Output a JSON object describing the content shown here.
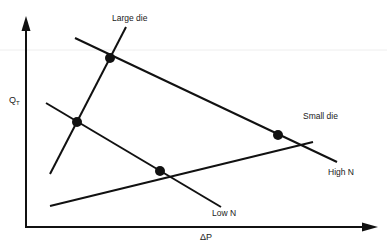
{
  "diagram": {
    "axes": {
      "y_label": "Q",
      "y_label_sub": "T",
      "x_label": "ΔP"
    },
    "lines": [
      {
        "name": "large-die-line",
        "label": "Large die",
        "x1": 50,
        "y1": 174,
        "x2": 126,
        "y2": 27
      },
      {
        "name": "small-die-line",
        "label": "Small die",
        "x1": 50,
        "y1": 206,
        "x2": 313,
        "y2": 142
      },
      {
        "name": "high-n-line",
        "label": "High N",
        "x1": 75,
        "y1": 38,
        "x2": 337,
        "y2": 162
      },
      {
        "name": "low-n-line",
        "label": "Low N",
        "x1": 46,
        "y1": 103,
        "x2": 221,
        "y2": 207
      }
    ],
    "labels": {
      "large_die": "Large die",
      "small_die": "Small die",
      "high_n": "High N",
      "low_n": "Low N"
    },
    "operating_points": [
      {
        "name": "large-die-high-n",
        "x": 110,
        "y": 58
      },
      {
        "name": "large-die-low-n",
        "x": 77,
        "y": 122
      },
      {
        "name": "small-die-low-n",
        "x": 160,
        "y": 171
      },
      {
        "name": "small-die-high-n",
        "x": 278,
        "y": 135
      }
    ],
    "colors": {
      "line": "#111111",
      "background": "#ffffff"
    }
  }
}
